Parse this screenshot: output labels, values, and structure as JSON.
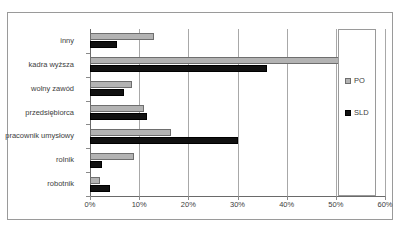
{
  "chart_data": {
    "type": "bar",
    "orientation": "horizontal",
    "title": "",
    "xlabel": "",
    "ylabel": "",
    "xlim": [
      0,
      60
    ],
    "xtick_labels": [
      "0%",
      "10%",
      "20%",
      "30%",
      "40%",
      "50%",
      "60%"
    ],
    "xticks": [
      0,
      10,
      20,
      30,
      40,
      50,
      60
    ],
    "grid": true,
    "legend_position": "right",
    "categories": [
      "inny",
      "kadra wyższa",
      "wolny zawód",
      "przedsiębiorca",
      "pracownik umysłowy",
      "rolnik",
      "robotnik"
    ],
    "series": [
      {
        "name": "PO",
        "color": "#b3b3b3",
        "values": [
          13,
          51,
          8.5,
          11,
          16.5,
          9,
          2
        ]
      },
      {
        "name": "SLD",
        "color": "#111111",
        "values": [
          5.5,
          36,
          7,
          11.5,
          30,
          2.5,
          4
        ]
      }
    ]
  },
  "legend": {
    "items": [
      {
        "label": "PO"
      },
      {
        "label": "SLD"
      }
    ]
  },
  "caption": {
    "text": ""
  }
}
